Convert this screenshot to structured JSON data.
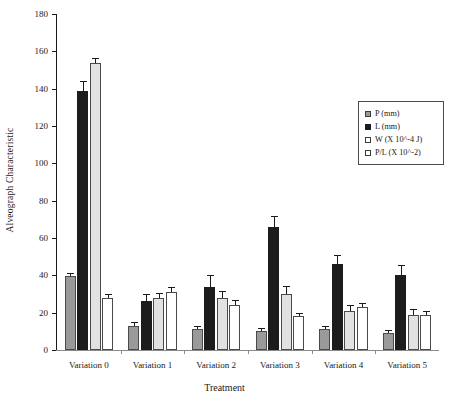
{
  "chart_data": {
    "type": "bar",
    "title": "",
    "xlabel": "Treatment",
    "ylabel": "Alveograph Characteristic",
    "categories": [
      "Variation 0",
      "Variation 1",
      "Variation 2",
      "Variation 3",
      "Variation 4",
      "Variation 5"
    ],
    "ylim": [
      0,
      180
    ],
    "yticks": [
      0,
      20,
      40,
      60,
      80,
      100,
      120,
      140,
      160,
      180
    ],
    "grid": false,
    "legend_position": "right",
    "series": [
      {
        "name": "P (mm)",
        "color": "#9a9a9a",
        "values": [
          39.5,
          13,
          11,
          10,
          11,
          9
        ],
        "errors": [
          1,
          1.5,
          1.5,
          1,
          1.5,
          1
        ]
      },
      {
        "name": "L (mm)",
        "color": "#1c1c1c",
        "values": [
          139,
          26,
          34,
          66,
          46,
          40
        ],
        "errors": [
          4.5,
          3.5,
          5.5,
          5,
          4.5,
          5
        ]
      },
      {
        "name": "W (X 10^-4 J)",
        "color": "#e2e2e2",
        "values": [
          153.5,
          28,
          28,
          30,
          21,
          19
        ],
        "errors": [
          2.5,
          2,
          3,
          3.5,
          2.5,
          2.5
        ]
      },
      {
        "name": "P/L (X 10^-2)",
        "color": "#ffffff",
        "values": [
          28,
          31,
          24,
          18,
          23,
          19
        ],
        "errors": [
          1.5,
          2,
          2,
          1.5,
          1.5,
          1.5
        ]
      }
    ]
  }
}
